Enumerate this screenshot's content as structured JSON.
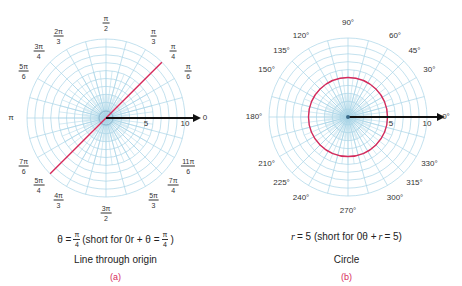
{
  "colors": {
    "grid": "#a9d4e6",
    "curve": "#d62a5b",
    "axis": "#111111",
    "label_text": "#333333",
    "sublabel": "#d62a5b"
  },
  "panel_a": {
    "angle_labels": [
      {
        "num": "π",
        "den": "2",
        "angle_deg": 90
      },
      {
        "num": "π",
        "den": "3",
        "angle_deg": 60
      },
      {
        "num": "π",
        "den": "4",
        "angle_deg": 45
      },
      {
        "num": "π",
        "den": "6",
        "angle_deg": 30
      },
      {
        "num": "2π",
        "den": "3",
        "angle_deg": 120
      },
      {
        "num": "3π",
        "den": "4",
        "angle_deg": 135
      },
      {
        "num": "5π",
        "den": "6",
        "angle_deg": 150
      },
      {
        "text": "π",
        "angle_deg": 180
      },
      {
        "num": "7π",
        "den": "6",
        "angle_deg": 210
      },
      {
        "num": "5π",
        "den": "4",
        "angle_deg": 225
      },
      {
        "num": "4π",
        "den": "3",
        "angle_deg": 240
      },
      {
        "num": "3π",
        "den": "2",
        "angle_deg": 270
      },
      {
        "num": "5π",
        "den": "3",
        "angle_deg": 300
      },
      {
        "num": "7π",
        "den": "4",
        "angle_deg": 315
      },
      {
        "num": "11π",
        "den": "6",
        "angle_deg": 330
      },
      {
        "text": "0",
        "angle_deg": 0
      }
    ],
    "radial_ticks": [
      "5",
      "10"
    ],
    "equation": {
      "lhs": "θ =",
      "frac_num": "π",
      "frac_den": "4",
      "short_prefix": "(short for 0r + θ =",
      "short_frac_num": "π",
      "short_frac_den": "4",
      "short_suffix": ")"
    },
    "title": "Line through origin",
    "sublabel": "(a)"
  },
  "panel_b": {
    "angle_labels": [
      {
        "text": "90°",
        "angle_deg": 90
      },
      {
        "text": "60°",
        "angle_deg": 60
      },
      {
        "text": "45°",
        "angle_deg": 45
      },
      {
        "text": "30°",
        "angle_deg": 30
      },
      {
        "text": "120°",
        "angle_deg": 120
      },
      {
        "text": "135°",
        "angle_deg": 135
      },
      {
        "text": "150°",
        "angle_deg": 150
      },
      {
        "text": "180°",
        "angle_deg": 180
      },
      {
        "text": "210°",
        "angle_deg": 210
      },
      {
        "text": "225°",
        "angle_deg": 225
      },
      {
        "text": "240°",
        "angle_deg": 240
      },
      {
        "text": "270°",
        "angle_deg": 270
      },
      {
        "text": "300°",
        "angle_deg": 300
      },
      {
        "text": "315°",
        "angle_deg": 315
      },
      {
        "text": "330°",
        "angle_deg": 330
      },
      {
        "text": "0°",
        "angle_deg": 0
      }
    ],
    "radial_ticks": [
      "5",
      "10"
    ],
    "equation": {
      "r": "r",
      "eq1": "= 5 (short for 0θ +",
      "r2": "r",
      "eq2": "= 5)"
    },
    "title": "Circle",
    "sublabel": "(b)"
  },
  "grid": {
    "rings": 10,
    "spoke_step_deg": 15,
    "curve_radius_units": 5,
    "line_angle_deg": 45
  }
}
